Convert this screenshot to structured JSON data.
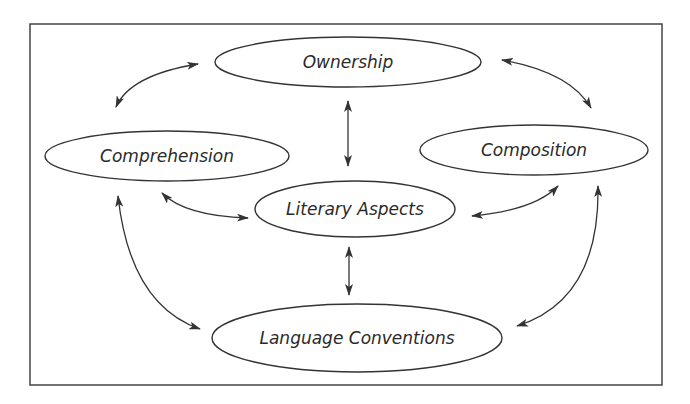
{
  "diagram": {
    "frame": {
      "x": 30,
      "y": 24,
      "w": 632,
      "h": 361,
      "stroke": "#444444"
    },
    "nodes": [
      {
        "id": "ownership",
        "label": "Ownership",
        "cx": 348,
        "cy": 62,
        "rx": 133,
        "ry": 25
      },
      {
        "id": "comprehension",
        "label": "Comprehension",
        "cx": 167,
        "cy": 156,
        "rx": 122,
        "ry": 25
      },
      {
        "id": "composition",
        "label": "Composition",
        "cx": 534,
        "cy": 150,
        "rx": 114,
        "ry": 25
      },
      {
        "id": "literary-aspects",
        "label": "Literary Aspects",
        "cx": 355,
        "cy": 209,
        "rx": 100,
        "ry": 28
      },
      {
        "id": "language-conventions",
        "label": "Language Conventions",
        "cx": 357,
        "cy": 338,
        "rx": 145,
        "ry": 34
      }
    ],
    "edges": [
      {
        "from": "ownership",
        "to": "comprehension",
        "bidirectional": true
      },
      {
        "from": "ownership",
        "to": "composition",
        "bidirectional": true
      },
      {
        "from": "ownership",
        "to": "literary-aspects",
        "bidirectional": true
      },
      {
        "from": "comprehension",
        "to": "literary-aspects",
        "bidirectional": true
      },
      {
        "from": "composition",
        "to": "literary-aspects",
        "bidirectional": true
      },
      {
        "from": "literary-aspects",
        "to": "language-conventions",
        "bidirectional": true
      },
      {
        "from": "comprehension",
        "to": "language-conventions",
        "bidirectional": true
      },
      {
        "from": "composition",
        "to": "language-conventions",
        "bidirectional": true
      }
    ],
    "colors": {
      "stroke": "#333333",
      "text": "#2a2a2a",
      "background": "#ffffff"
    }
  }
}
